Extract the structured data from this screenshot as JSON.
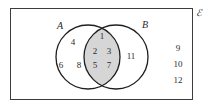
{
  "figure": {
    "type": "venn-diagram",
    "universe_label": "ℰ",
    "sets": [
      {
        "key": "A",
        "label": "A"
      },
      {
        "key": "B",
        "label": "B"
      }
    ],
    "regions": {
      "a_only": {
        "name": "A only",
        "elements": [
          "4",
          "6",
          "8"
        ]
      },
      "intersection": {
        "name": "A intersect B",
        "shaded": true,
        "shade_color": "#d6d6d6",
        "elements": [
          "1",
          "2",
          "3",
          "5",
          "7"
        ]
      },
      "b_only": {
        "name": "B only",
        "elements": [
          "11"
        ]
      },
      "outside": {
        "name": "Outside both sets",
        "elements": [
          "9",
          "10",
          "12"
        ]
      }
    },
    "colors": {
      "stroke": "#3c3c3c",
      "circle_stroke": "#1f1f1f",
      "text": "#2b2b2b",
      "shade": "#d6d6d6",
      "background": "#ffffff"
    }
  }
}
